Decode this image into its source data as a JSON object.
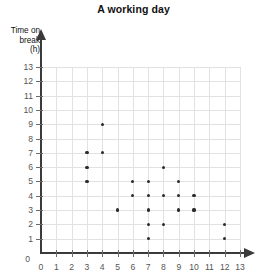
{
  "chart_data": {
    "type": "scatter",
    "title": "A working day",
    "xlabel": "",
    "ylabel": "Time on break (h)",
    "ylabel_lines": [
      "Time on",
      "break",
      "(h)"
    ],
    "xlim": [
      0,
      13
    ],
    "ylim": [
      0,
      13
    ],
    "x_ticks": [
      0,
      1,
      2,
      3,
      4,
      5,
      6,
      7,
      8,
      9,
      10,
      11,
      12,
      13
    ],
    "y_ticks": [
      0,
      1,
      2,
      3,
      4,
      5,
      6,
      7,
      8,
      9,
      10,
      11,
      12,
      13
    ],
    "grid": true,
    "legend": "none",
    "marker_color": "#2b2b2b",
    "grid_color": "#e2e2e2",
    "axis_color": "#3a3a3a",
    "points": [
      {
        "x": 3,
        "y": 5
      },
      {
        "x": 3,
        "y": 6
      },
      {
        "x": 3,
        "y": 7
      },
      {
        "x": 4,
        "y": 7
      },
      {
        "x": 4,
        "y": 9
      },
      {
        "x": 5,
        "y": 3
      },
      {
        "x": 6,
        "y": 4
      },
      {
        "x": 6,
        "y": 5
      },
      {
        "x": 7,
        "y": 1
      },
      {
        "x": 7,
        "y": 2
      },
      {
        "x": 7,
        "y": 3
      },
      {
        "x": 7,
        "y": 4
      },
      {
        "x": 7,
        "y": 5
      },
      {
        "x": 8,
        "y": 2
      },
      {
        "x": 8,
        "y": 4
      },
      {
        "x": 8,
        "y": 6
      },
      {
        "x": 9,
        "y": 3
      },
      {
        "x": 9,
        "y": 4
      },
      {
        "x": 9,
        "y": 5
      },
      {
        "x": 10,
        "y": 3
      },
      {
        "x": 10,
        "y": 4
      },
      {
        "x": 12,
        "y": 1
      },
      {
        "x": 12,
        "y": 2
      }
    ]
  }
}
